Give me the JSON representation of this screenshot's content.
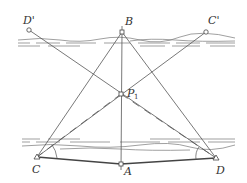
{
  "diagram": {
    "type": "surveying-geometry",
    "colors": {
      "line": "#555555",
      "river": "#777777",
      "background": "#ffffff"
    },
    "labels": {
      "D_prime": "D'",
      "C_prime": "C'",
      "B": "B",
      "P1_main": "P",
      "P1_sub": "1",
      "C": "C",
      "D": "D",
      "A": "A"
    },
    "points": {
      "D_prime": {
        "x": 29,
        "y": 30,
        "marker": "circle"
      },
      "B": {
        "x": 122,
        "y": 32,
        "marker": "square"
      },
      "C_prime": {
        "x": 206,
        "y": 32,
        "marker": "circle"
      },
      "P1": {
        "x": 121,
        "y": 94,
        "marker": "square"
      },
      "C": {
        "x": 37,
        "y": 157,
        "marker": "triangle"
      },
      "A": {
        "x": 121,
        "y": 164,
        "marker": "square"
      },
      "D": {
        "x": 216,
        "y": 158,
        "marker": "triangle"
      }
    },
    "segments": [
      {
        "from": "B",
        "to": "C",
        "style": "solid"
      },
      {
        "from": "B",
        "to": "D",
        "style": "solid"
      },
      {
        "from": "B",
        "to": "A",
        "style": "solid"
      },
      {
        "from": "D_prime",
        "to": "D",
        "style": "solid"
      },
      {
        "from": "C_prime",
        "to": "C",
        "style": "solid"
      },
      {
        "from": "C",
        "to": "A",
        "style": "thick"
      },
      {
        "from": "A",
        "to": "D",
        "style": "thick"
      },
      {
        "from": "P1",
        "to": "C",
        "style": "dashed"
      },
      {
        "from": "P1",
        "to": "D",
        "style": "dashed"
      }
    ]
  }
}
